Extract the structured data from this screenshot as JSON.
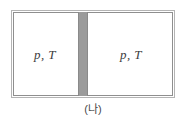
{
  "figure": {
    "caption": "(나)",
    "container": {
      "name": "rigid-container",
      "border_color": "#8f8f8f",
      "fill_color": "#ffffff"
    },
    "partition": {
      "name": "partition-wall",
      "color": "#9b9b9b",
      "orientation": "vertical"
    },
    "chambers": [
      {
        "id": "left",
        "label": "p, T"
      },
      {
        "id": "right",
        "label": "p, T"
      }
    ]
  }
}
